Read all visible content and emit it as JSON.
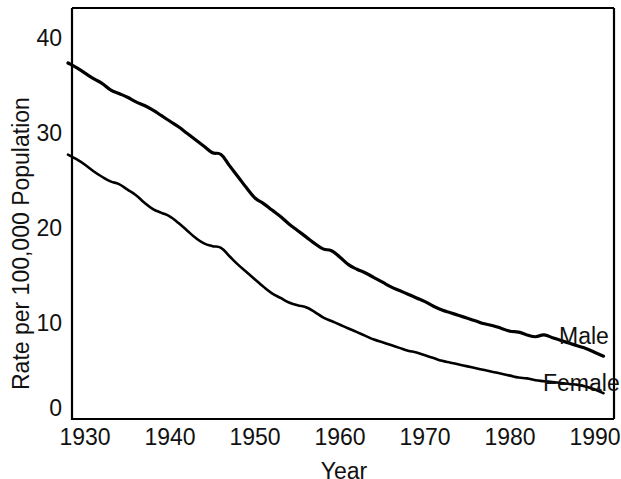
{
  "chart_data": {
    "type": "line",
    "title": "",
    "xlabel": "Year",
    "ylabel": "Rate per 100,000 Population",
    "xlim": [
      1928,
      1992
    ],
    "ylim": [
      0,
      43
    ],
    "xticks": [
      1930,
      1940,
      1950,
      1960,
      1970,
      1980,
      1990
    ],
    "xtick_labels": [
      "1930",
      "1940",
      "1950",
      "1960",
      "1970",
      "1980",
      "1990"
    ],
    "yticks": [
      0,
      10,
      20,
      30,
      40
    ],
    "ytick_labels": [
      "0",
      "10",
      "20",
      "30",
      "40"
    ],
    "grid": false,
    "legend_position": "inline-right-end",
    "line_color": "#000000",
    "frame_color": "#000000",
    "background": "#ffffff",
    "x": [
      1928,
      1929,
      1930,
      1931,
      1932,
      1933,
      1934,
      1935,
      1936,
      1937,
      1938,
      1939,
      1940,
      1941,
      1942,
      1943,
      1944,
      1945,
      1946,
      1947,
      1948,
      1949,
      1950,
      1951,
      1952,
      1953,
      1954,
      1955,
      1956,
      1957,
      1958,
      1959,
      1960,
      1961,
      1962,
      1963,
      1964,
      1965,
      1966,
      1967,
      1968,
      1969,
      1970,
      1971,
      1972,
      1973,
      1974,
      1975,
      1976,
      1977,
      1978,
      1979,
      1980,
      1981,
      1982,
      1983,
      1984,
      1985,
      1986,
      1987,
      1988,
      1989,
      1990,
      1991
    ],
    "series": [
      {
        "name": "Male",
        "label": "Male",
        "values": [
          37.3,
          36.8,
          36.2,
          35.6,
          35.1,
          34.4,
          34.0,
          33.6,
          33.1,
          32.7,
          32.2,
          31.6,
          31.0,
          30.4,
          29.7,
          29.0,
          28.3,
          27.6,
          27.4,
          26.2,
          25.0,
          23.8,
          22.7,
          22.1,
          21.4,
          20.7,
          19.9,
          19.2,
          18.5,
          17.8,
          17.2,
          17.0,
          16.3,
          15.5,
          15.0,
          14.6,
          14.1,
          13.6,
          13.1,
          12.7,
          12.3,
          11.9,
          11.5,
          11.0,
          10.6,
          10.3,
          10.0,
          9.7,
          9.4,
          9.1,
          8.9,
          8.6,
          8.3,
          8.2,
          7.9,
          7.7,
          7.9,
          7.6,
          7.3,
          7.0,
          6.7,
          6.4,
          6.0,
          5.6
        ]
      },
      {
        "name": "Female",
        "label": "Female",
        "values": [
          27.4,
          26.9,
          26.3,
          25.6,
          25.0,
          24.5,
          24.2,
          23.6,
          23.0,
          22.2,
          21.5,
          21.1,
          20.7,
          20.0,
          19.2,
          18.4,
          17.8,
          17.5,
          17.3,
          16.4,
          15.5,
          14.7,
          13.9,
          13.1,
          12.4,
          11.9,
          11.4,
          11.1,
          10.9,
          10.4,
          9.8,
          9.4,
          9.0,
          8.6,
          8.2,
          7.8,
          7.4,
          7.1,
          6.8,
          6.5,
          6.2,
          6.0,
          5.7,
          5.4,
          5.1,
          4.9,
          4.7,
          4.5,
          4.3,
          4.1,
          3.9,
          3.7,
          3.5,
          3.3,
          3.2,
          3.0,
          2.9,
          2.8,
          2.7,
          2.6,
          2.5,
          2.3,
          2.0,
          1.6
        ]
      }
    ]
  },
  "axes": {
    "xlabel": "Year",
    "ylabel": "Rate per 100,000 Population",
    "ytick_labels": [
      "40",
      "30",
      "20",
      "10",
      "0"
    ],
    "xtick_labels": [
      "1930",
      "1940",
      "1950",
      "1960",
      "1970",
      "1980",
      "1990"
    ]
  },
  "labels": {
    "male": "Male",
    "female": "Female"
  }
}
